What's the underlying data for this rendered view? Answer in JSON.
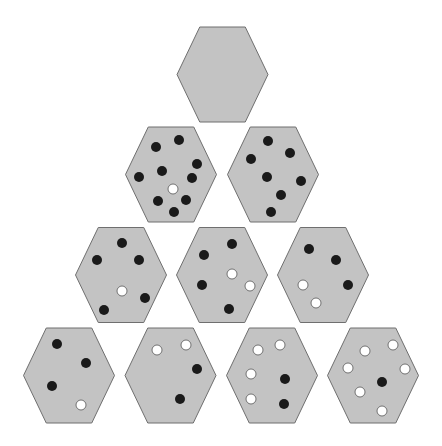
{
  "diagram": {
    "title": "",
    "colors": {
      "background": "#ffffff",
      "hex_fill": "#c3c3c3",
      "hex_stroke": "#6f6f6f",
      "dot_black": "#1a1a1a",
      "dot_white": "#ffffff"
    },
    "dot_radius": 5,
    "hex_half_width": 45.5,
    "hex_half_height": 47.5,
    "hexagons": [
      {
        "id": "r1c1",
        "cx": 222.5,
        "cy": 74.5,
        "dots": []
      },
      {
        "id": "r2c1",
        "cx": 171,
        "cy": 174.5,
        "dots": [
          {
            "x": 179,
            "y": 140,
            "color": "black"
          },
          {
            "x": 156,
            "y": 147,
            "color": "black"
          },
          {
            "x": 197,
            "y": 164,
            "color": "black"
          },
          {
            "x": 162,
            "y": 171,
            "color": "black"
          },
          {
            "x": 139,
            "y": 177,
            "color": "black"
          },
          {
            "x": 192,
            "y": 178,
            "color": "black"
          },
          {
            "x": 173,
            "y": 189,
            "color": "white"
          },
          {
            "x": 158,
            "y": 201,
            "color": "black"
          },
          {
            "x": 186,
            "y": 200,
            "color": "black"
          },
          {
            "x": 174,
            "y": 212,
            "color": "black"
          }
        ]
      },
      {
        "id": "r2c2",
        "cx": 273,
        "cy": 174.5,
        "dots": [
          {
            "x": 268,
            "y": 141,
            "color": "black"
          },
          {
            "x": 251,
            "y": 159,
            "color": "black"
          },
          {
            "x": 290,
            "y": 153,
            "color": "black"
          },
          {
            "x": 267,
            "y": 177,
            "color": "black"
          },
          {
            "x": 301,
            "y": 181,
            "color": "black"
          },
          {
            "x": 281,
            "y": 195,
            "color": "black"
          },
          {
            "x": 271,
            "y": 212,
            "color": "black"
          }
        ]
      },
      {
        "id": "r3c1",
        "cx": 121,
        "cy": 275,
        "dots": [
          {
            "x": 122,
            "y": 243,
            "color": "black"
          },
          {
            "x": 97,
            "y": 260,
            "color": "black"
          },
          {
            "x": 139,
            "y": 260,
            "color": "black"
          },
          {
            "x": 122,
            "y": 291,
            "color": "white"
          },
          {
            "x": 145,
            "y": 298,
            "color": "black"
          },
          {
            "x": 104,
            "y": 310,
            "color": "black"
          }
        ]
      },
      {
        "id": "r3c2",
        "cx": 222,
        "cy": 275,
        "dots": [
          {
            "x": 232,
            "y": 244,
            "color": "black"
          },
          {
            "x": 204,
            "y": 255,
            "color": "black"
          },
          {
            "x": 232,
            "y": 274,
            "color": "white"
          },
          {
            "x": 202,
            "y": 285,
            "color": "black"
          },
          {
            "x": 250,
            "y": 286,
            "color": "white"
          },
          {
            "x": 229,
            "y": 309,
            "color": "black"
          }
        ]
      },
      {
        "id": "r3c3",
        "cx": 323,
        "cy": 275,
        "dots": [
          {
            "x": 309,
            "y": 249,
            "color": "black"
          },
          {
            "x": 336,
            "y": 260,
            "color": "black"
          },
          {
            "x": 303,
            "y": 285,
            "color": "white"
          },
          {
            "x": 348,
            "y": 285,
            "color": "black"
          },
          {
            "x": 316,
            "y": 303,
            "color": "white"
          }
        ]
      },
      {
        "id": "r4c1",
        "cx": 69,
        "cy": 375.5,
        "dots": [
          {
            "x": 57,
            "y": 344,
            "color": "black"
          },
          {
            "x": 86,
            "y": 363,
            "color": "black"
          },
          {
            "x": 52,
            "y": 386,
            "color": "black"
          },
          {
            "x": 81,
            "y": 405,
            "color": "white"
          }
        ]
      },
      {
        "id": "r4c2",
        "cx": 170.5,
        "cy": 375.5,
        "dots": [
          {
            "x": 157,
            "y": 350,
            "color": "white"
          },
          {
            "x": 186,
            "y": 345,
            "color": "white"
          },
          {
            "x": 197,
            "y": 369,
            "color": "black"
          },
          {
            "x": 180,
            "y": 399,
            "color": "black"
          }
        ]
      },
      {
        "id": "r4c3",
        "cx": 272,
        "cy": 375.5,
        "dots": [
          {
            "x": 258,
            "y": 350,
            "color": "white"
          },
          {
            "x": 280,
            "y": 345,
            "color": "white"
          },
          {
            "x": 251,
            "y": 374,
            "color": "white"
          },
          {
            "x": 285,
            "y": 379,
            "color": "black"
          },
          {
            "x": 251,
            "y": 399,
            "color": "white"
          },
          {
            "x": 284,
            "y": 404,
            "color": "black"
          }
        ]
      },
      {
        "id": "r4c4",
        "cx": 373,
        "cy": 375.5,
        "dots": [
          {
            "x": 365,
            "y": 351,
            "color": "white"
          },
          {
            "x": 393,
            "y": 345,
            "color": "white"
          },
          {
            "x": 348,
            "y": 368,
            "color": "white"
          },
          {
            "x": 405,
            "y": 369,
            "color": "white"
          },
          {
            "x": 382,
            "y": 382,
            "color": "black"
          },
          {
            "x": 360,
            "y": 392,
            "color": "white"
          },
          {
            "x": 382,
            "y": 411,
            "color": "white"
          }
        ]
      }
    ]
  }
}
